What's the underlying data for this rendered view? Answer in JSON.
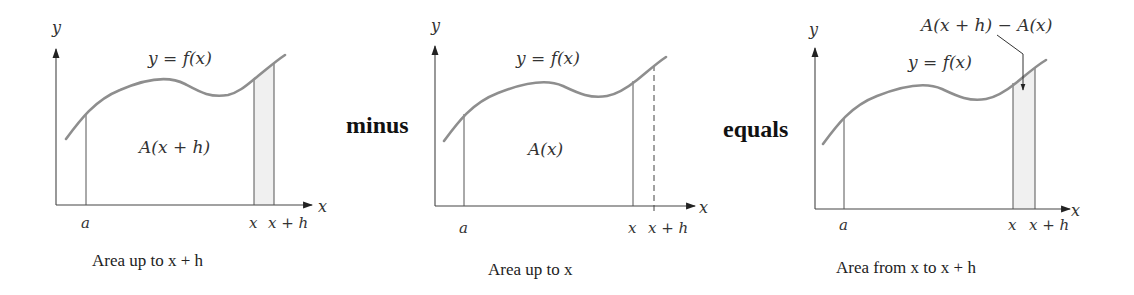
{
  "diagram": {
    "panels": [
      {
        "id": "area-up-to-x-plus-h",
        "y_axis_label": "y",
        "x_axis_label": "x",
        "curve_label": "y = f(x)",
        "region_label": "A(x + h)",
        "tick_a": "a",
        "tick_x": "x",
        "tick_xh": "x + h",
        "caption": "Area up to x + h",
        "shaded_strip": true
      },
      {
        "id": "area-up-to-x",
        "y_axis_label": "y",
        "x_axis_label": "x",
        "curve_label": "y = f(x)",
        "region_label": "A(x)",
        "tick_a": "a",
        "tick_x": "x",
        "tick_xh": "x + h",
        "caption": "Area up to x",
        "dashed_line_at": "x + h"
      },
      {
        "id": "area-from-x-to-x-plus-h",
        "y_axis_label": "y",
        "x_axis_label": "x",
        "curve_label": "y = f(x)",
        "callout_label": "A(x + h) − A(x)",
        "tick_a": "a",
        "tick_x": "x",
        "tick_xh": "x + h",
        "caption": "Area from x to x + h",
        "shaded_strip": true
      }
    ],
    "operators": {
      "first": "minus",
      "second": "equals"
    },
    "colors": {
      "curve": "#8e8e8e",
      "strip_fill": "#f0f0f0",
      "axis": "#444444"
    }
  }
}
